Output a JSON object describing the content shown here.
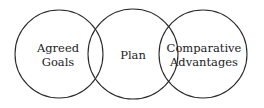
{
  "diagram": {
    "type": "venn",
    "stroke_color": "#2a2a2a",
    "circles": [
      {
        "id": "agreed-goals",
        "lines": [
          "Agreed",
          "Goals"
        ],
        "cx": 59,
        "cy": 54,
        "r": 44
      },
      {
        "id": "plan",
        "lines": [
          "Plan"
        ],
        "cx": 133,
        "cy": 54,
        "r": 45
      },
      {
        "id": "comparative-advantages",
        "lines": [
          "Comparative",
          "Advantages"
        ],
        "cx": 203,
        "cy": 54,
        "r": 44
      }
    ]
  }
}
